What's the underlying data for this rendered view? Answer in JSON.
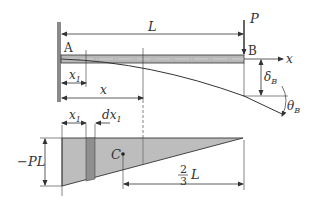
{
  "diagram": {
    "type": "cantilever-beam-moment-area",
    "beam": {
      "label_fixed_end": "A",
      "label_free_end": "B",
      "length_label": "L",
      "load_label": "P",
      "axis_label": "x",
      "deflection_label": "δ",
      "deflection_sub": "B",
      "rotation_label": "θ",
      "rotation_sub": "B"
    },
    "dimensions": {
      "x1_label": "x",
      "x1_sub": "1",
      "x_label": "x",
      "dx1_label": "dx",
      "dx1_sub": "1"
    },
    "moment_diagram": {
      "max_moment_label": "−PL",
      "centroid_label": "C",
      "centroid_dist_num": "2",
      "centroid_dist_den": "3",
      "centroid_dist_var": "L"
    },
    "colors": {
      "fill": "#bdbdbd",
      "strip": "#8f8f8f",
      "line": "#333333",
      "beam": "#9a9a9a",
      "wall": "#8a8a8a"
    }
  }
}
